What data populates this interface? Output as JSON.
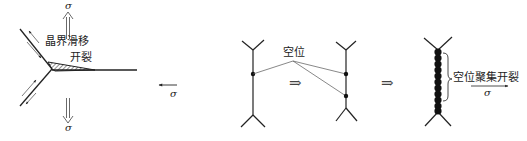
{
  "panel_a": {
    "labels": {
      "gb_slide": "晶界滑移",
      "crack": "开裂",
      "sigma_top": "σ",
      "sigma_bottom": "σ",
      "sigma_left": "σ"
    }
  },
  "panel_b": {
    "labels": {
      "vacancy": "空位",
      "implies_1": "⇒",
      "implies_2": "⇒"
    }
  },
  "panel_c": {
    "labels": {
      "vacancy_cluster_crack": "空位聚集开裂",
      "sigma_right": "σ"
    }
  },
  "colors": {
    "line": "#222222",
    "thin_line": "#555555",
    "background": "#ffffff"
  }
}
